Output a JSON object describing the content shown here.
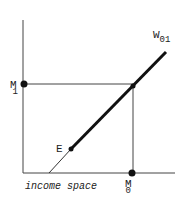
{
  "diagram": {
    "type": "economics-income-space",
    "axis_label_bottom": "income space",
    "curve_label": {
      "main": "W",
      "sub": "01"
    },
    "point_E": "E",
    "point_M1": {
      "main": "M",
      "sub": "1"
    },
    "point_M0": {
      "main": "M",
      "sub": "0"
    },
    "colors": {
      "ink": "#222222",
      "background": "#ffffff"
    }
  }
}
